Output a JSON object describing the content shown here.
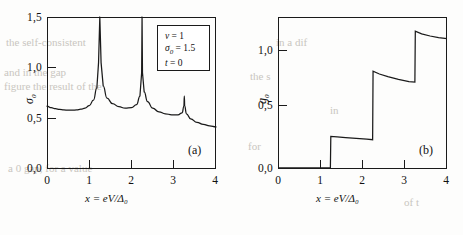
{
  "figure": {
    "xlabel": "x = eV/Δ₀",
    "panels": [
      {
        "tag": "(a)",
        "ylabel": "σ",
        "ylabel_sub": "0",
        "yticks": [
          "0,0",
          "0,5",
          "1,0",
          "1,5"
        ],
        "xticks": [
          "0",
          "1",
          "2",
          "3",
          "4"
        ]
      },
      {
        "tag": "(b)",
        "ylabel": "g",
        "ylabel_sub": "0",
        "yticks": [
          "0,0",
          "0,5",
          "1,0"
        ],
        "xticks": [
          "0",
          "1",
          "2",
          "3",
          "4"
        ]
      }
    ],
    "legend": {
      "line1_sym": "ν",
      "line1_val": "= 1",
      "line2_sym": "σ",
      "line2_sub": "0",
      "line2_val": "= 1.5",
      "line3_sym": "t",
      "line3_val": "= 0"
    },
    "ghost_text": [
      "the self-consistent",
      "and in the gap",
      "figure the result of the",
      "a 0 gap, for a value",
      "in a dif",
      "the s",
      "in",
      "for",
      "of t"
    ]
  },
  "chart_data": [
    {
      "type": "line",
      "title": "",
      "panel": "(a)",
      "xlabel": "x = eV/Δ₀",
      "ylabel": "σ₀",
      "xlim": [
        0,
        4
      ],
      "ylim": [
        0,
        1.5
      ],
      "xticks": [
        0,
        1,
        2,
        3,
        4
      ],
      "yticks": [
        0.0,
        0.5,
        1.0,
        1.5
      ],
      "grid": false,
      "annotations": [
        "ν = 1",
        "σ₀ = 1.5",
        "t = 0"
      ],
      "description": "Conductivity with three divergent resonance peaks",
      "peaks": [
        {
          "x": 1.25,
          "height": 1.5
        },
        {
          "x": 2.25,
          "height": 1.5
        },
        {
          "x": 3.25,
          "height": 0.72
        }
      ],
      "x": [
        0.0,
        0.1,
        0.2,
        0.3,
        0.4,
        0.5,
        0.6,
        0.7,
        0.8,
        0.9,
        1.0,
        1.1,
        1.18,
        1.22,
        1.25,
        1.28,
        1.33,
        1.42,
        1.55,
        1.7,
        1.85,
        2.0,
        2.12,
        2.2,
        2.24,
        2.25,
        2.26,
        2.3,
        2.38,
        2.5,
        2.65,
        2.8,
        2.95,
        3.1,
        3.2,
        3.24,
        3.25,
        3.26,
        3.3,
        3.4,
        3.55,
        3.7,
        3.85,
        4.0
      ],
      "y": [
        0.62,
        0.605,
        0.595,
        0.588,
        0.583,
        0.58,
        0.58,
        0.583,
        0.59,
        0.6,
        0.625,
        0.68,
        0.8,
        1.05,
        1.5,
        1.05,
        0.82,
        0.7,
        0.645,
        0.615,
        0.6,
        0.605,
        0.635,
        0.72,
        0.95,
        1.5,
        0.95,
        0.76,
        0.665,
        0.6,
        0.565,
        0.545,
        0.535,
        0.535,
        0.555,
        0.62,
        0.72,
        0.62,
        0.545,
        0.495,
        0.46,
        0.44,
        0.425,
        0.415
      ]
    },
    {
      "type": "line",
      "title": "",
      "panel": "(b)",
      "xlabel": "x = eV/Δ₀",
      "ylabel": "g₀",
      "xlim": [
        0,
        4
      ],
      "ylim": [
        0,
        1.4
      ],
      "xticks": [
        0,
        1,
        2,
        3,
        4
      ],
      "yticks": [
        0.0,
        0.5,
        1.0
      ],
      "grid": false,
      "description": "Staircase conductance with three sharp risers that decay slightly after each step",
      "steps": [
        {
          "x": 1.25,
          "from": 0.0,
          "to": 0.3
        },
        {
          "x": 2.25,
          "from": 0.27,
          "to": 0.9
        },
        {
          "x": 3.25,
          "from": 0.8,
          "to": 1.27
        }
      ],
      "x": [
        0.0,
        0.4,
        0.8,
        1.1,
        1.24,
        1.25,
        1.4,
        1.6,
        1.85,
        2.1,
        2.24,
        2.25,
        2.4,
        2.6,
        2.85,
        3.1,
        3.24,
        3.25,
        3.4,
        3.6,
        3.8,
        4.0
      ],
      "y": [
        0.01,
        0.01,
        0.01,
        0.01,
        0.01,
        0.3,
        0.295,
        0.29,
        0.283,
        0.276,
        0.27,
        0.9,
        0.875,
        0.85,
        0.825,
        0.805,
        0.8,
        1.27,
        1.245,
        1.225,
        1.21,
        1.2
      ]
    }
  ]
}
